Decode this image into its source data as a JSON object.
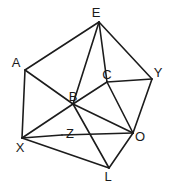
{
  "diagram": {
    "type": "undirected-graph",
    "title": "",
    "width": 174,
    "height": 189,
    "background_color": "#ffffff",
    "edge_color": "#1c1c1c",
    "label_color": "#1a1a1a",
    "nodes": [
      {
        "id": "A",
        "label": "A",
        "x": 16,
        "y": 62,
        "px": 25,
        "py": 70
      },
      {
        "id": "E",
        "label": "E",
        "x": 96,
        "y": 12,
        "px": 99,
        "py": 22
      },
      {
        "id": "B",
        "label": "B",
        "x": 73,
        "y": 96,
        "px": 73,
        "py": 104
      },
      {
        "id": "C",
        "label": "C",
        "x": 107,
        "y": 74,
        "px": 107,
        "py": 82
      },
      {
        "id": "Y",
        "label": "Y",
        "x": 158,
        "y": 72,
        "px": 152,
        "py": 79
      },
      {
        "id": "X",
        "label": "X",
        "x": 20,
        "y": 147,
        "px": 22,
        "py": 138
      },
      {
        "id": "Z",
        "label": "Z",
        "x": 70,
        "y": 133,
        "px": 62,
        "py": 135
      },
      {
        "id": "O",
        "label": "O",
        "x": 140,
        "y": 136,
        "px": 133,
        "py": 133
      },
      {
        "id": "L",
        "label": "L",
        "x": 108,
        "y": 176,
        "px": 109,
        "py": 168
      }
    ],
    "edges": [
      {
        "from": "A",
        "to": "E"
      },
      {
        "from": "A",
        "to": "B"
      },
      {
        "from": "A",
        "to": "X"
      },
      {
        "from": "E",
        "to": "B"
      },
      {
        "from": "E",
        "to": "C"
      },
      {
        "from": "E",
        "to": "Y"
      },
      {
        "from": "B",
        "to": "C"
      },
      {
        "from": "B",
        "to": "X"
      },
      {
        "from": "B",
        "to": "O"
      },
      {
        "from": "B",
        "to": "L"
      },
      {
        "from": "C",
        "to": "Y"
      },
      {
        "from": "C",
        "to": "O"
      },
      {
        "from": "Y",
        "to": "O"
      },
      {
        "from": "X",
        "to": "Z"
      },
      {
        "from": "X",
        "to": "L"
      },
      {
        "from": "Z",
        "to": "O"
      },
      {
        "from": "O",
        "to": "L"
      }
    ]
  }
}
